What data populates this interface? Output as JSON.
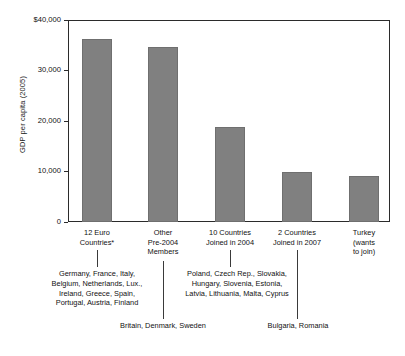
{
  "chart_data": {
    "type": "bar",
    "title": "",
    "subtitle": "",
    "xlabel": "",
    "ylabel": "GDP per capita (2005)",
    "ylim": [
      0,
      40000
    ],
    "yticks": [
      0,
      10000,
      20000,
      30000,
      40000
    ],
    "ytick_labels": [
      "0",
      "10,000",
      "20,000",
      "30,000",
      "$40,000"
    ],
    "grid": false,
    "legend": null,
    "bar_color": "#808080",
    "categories": [
      "12 Euro Countries*",
      "Other Pre-2004 Members",
      "10 Countries Joined in 2004",
      "2 Countries Joined in 2007",
      "Turkey (wants to join)"
    ],
    "values": [
      36300,
      34600,
      18800,
      9900,
      9200
    ],
    "annotations": [
      "Germany, France, Italy,\nBelgium, Netherlands, Lux.,\nIreland, Greece, Spain,\nPortugal, Austria, Finland",
      "Britain, Denmark, Sweden",
      "Poland, Czech Rep., Slovakia,\nHungary, Slovenia, Estonia,\nLatvia, Lithuania, Malta, Cyprus",
      "Bulgaria, Romania"
    ]
  },
  "axis": {
    "y_title": "GDP per capita (2005)",
    "ticks": [
      {
        "label": "$40,000",
        "value": 40000
      },
      {
        "label": "30,000",
        "value": 30000
      },
      {
        "label": "20,000",
        "value": 20000
      },
      {
        "label": "10,000",
        "value": 10000
      },
      {
        "label": "0",
        "value": 0
      }
    ]
  },
  "categories": [
    {
      "line1": "12 Euro",
      "line2": "Countries*",
      "line3": ""
    },
    {
      "line1": "Other",
      "line2": "Pre-2004",
      "line3": "Members"
    },
    {
      "line1": "10 Countries",
      "line2": "Joined in 2004",
      "line3": ""
    },
    {
      "line1": "2 Countries",
      "line2": "Joined in 2007",
      "line3": ""
    },
    {
      "line1": "Turkey",
      "line2": "(wants",
      "line3": "to join)"
    }
  ],
  "annotations": {
    "euro12": "Germany, France, Italy,\nBelgium, Netherlands, Lux.,\nIreland, Greece, Spain,\nPortugal, Austria, Finland",
    "other_pre2004": "Britain, Denmark, Sweden",
    "joined2004": "Poland, Czech Rep., Slovakia,\nHungary, Slovenia, Estonia,\nLatvia, Lithuania, Malta, Cyprus",
    "joined2007": "Bulgaria, Romania"
  }
}
